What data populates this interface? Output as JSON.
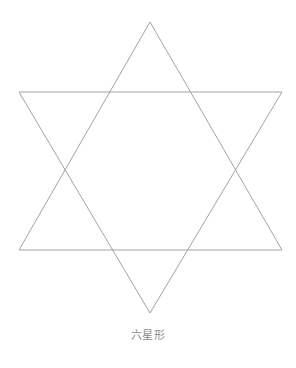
{
  "figure": {
    "name": "hexagram-star-of-david",
    "caption": "六星形",
    "caption_color": "#8c8c8c",
    "background_color": "#ffffff",
    "stroke_color": "#a3a3a3",
    "stroke_width": 1,
    "canvas": {
      "width": 296,
      "height": 368
    },
    "shape": {
      "type": "hexagram",
      "description": "two overlapping equilateral triangles forming a six-pointed star outline",
      "triangles": [
        {
          "name": "upward-triangle",
          "orientation": "up",
          "points": "150,22 282,250 19,250"
        },
        {
          "name": "downward-triangle",
          "orientation": "down",
          "points": "150,313 19,92 282,92"
        }
      ],
      "outer_points": [
        {
          "name": "top-point",
          "x": 150,
          "y": 22
        },
        {
          "name": "upper-right-point",
          "x": 282,
          "y": 92
        },
        {
          "name": "lower-right-point",
          "x": 282,
          "y": 250
        },
        {
          "name": "bottom-point",
          "x": 150,
          "y": 313
        },
        {
          "name": "lower-left-point",
          "x": 19,
          "y": 250
        },
        {
          "name": "upper-left-point",
          "x": 19,
          "y": 92
        }
      ],
      "inner_hexagon_vertices": [
        {
          "x": 110,
          "y": 92
        },
        {
          "x": 190,
          "y": 92
        },
        {
          "x": 243,
          "y": 171
        },
        {
          "x": 190,
          "y": 250
        },
        {
          "x": 110,
          "y": 250
        },
        {
          "x": 58,
          "y": 171
        }
      ]
    }
  }
}
